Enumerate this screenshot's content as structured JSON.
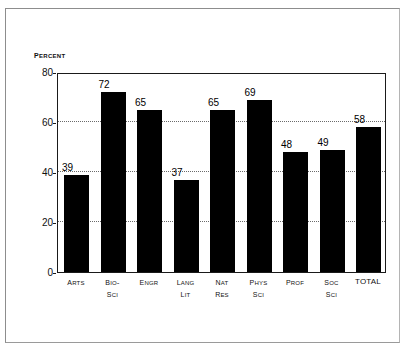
{
  "chart_data": {
    "type": "bar",
    "title": "",
    "subtitle": "",
    "xlabel": "",
    "ylabel": "Percent",
    "ylim": [
      0,
      80
    ],
    "ytick_values": [
      0,
      20,
      40,
      60,
      80
    ],
    "ytick_labels": [
      "0",
      "20",
      "40",
      "60",
      "80"
    ],
    "grid": "horizontal-dotted",
    "gridline_values": [
      20,
      40,
      60
    ],
    "legend": "none",
    "bar_color": "#000000",
    "categories": [
      "Arts",
      "Bio- Sci",
      "Engr",
      "Lang Lit",
      "Nat Res",
      "Phys Sci",
      "Prof",
      "Soc Sci",
      "TOTAL"
    ],
    "category_lines": [
      [
        "Arts"
      ],
      [
        "Bio-",
        "Sci"
      ],
      [
        "Engr"
      ],
      [
        "Lang",
        "Lit"
      ],
      [
        "Nat",
        "Res"
      ],
      [
        "Phys",
        "Sci"
      ],
      [
        "Prof"
      ],
      [
        "Soc",
        "Sci"
      ],
      [
        "TOTAL"
      ]
    ],
    "values": [
      39,
      72,
      65,
      37,
      65,
      69,
      48,
      49,
      58
    ],
    "value_labels": [
      "39",
      "72",
      "65",
      "37",
      "65",
      "69",
      "48",
      "49",
      "58"
    ]
  },
  "axis": {
    "y_caption": "Percent"
  }
}
